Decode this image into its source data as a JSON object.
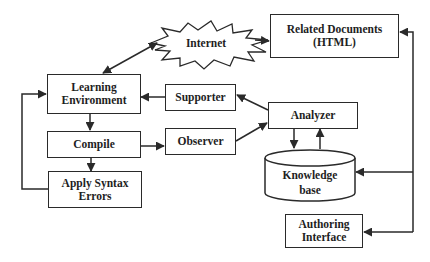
{
  "diagram": {
    "nodes": {
      "internet": {
        "label": "Internet",
        "shape": "starburst"
      },
      "related_documents": {
        "line1": "Related Documents",
        "line2": "(HTML)",
        "shape": "rectangle"
      },
      "learning_environment": {
        "line1": "Learning",
        "line2": "Environment",
        "shape": "rectangle"
      },
      "supporter": {
        "label": "Supporter",
        "shape": "rectangle"
      },
      "compile": {
        "label": "Compile",
        "shape": "rectangle"
      },
      "observer": {
        "label": "Observer",
        "shape": "rectangle"
      },
      "analyzer": {
        "label": "Analyzer",
        "shape": "rectangle"
      },
      "knowledge_base": {
        "line1": "Knowledge",
        "line2": "base",
        "shape": "cylinder"
      },
      "apply_syntax_errors": {
        "line1": "Apply Syntax",
        "line2": "Errors",
        "shape": "rectangle"
      },
      "authoring_interface": {
        "line1": "Authoring",
        "line2": "Interface",
        "shape": "rectangle"
      }
    },
    "edges": [
      {
        "from": "internet",
        "to": "learning_environment",
        "bidirectional": true
      },
      {
        "from": "internet",
        "to": "related_documents"
      },
      {
        "from": "learning_environment",
        "to": "compile"
      },
      {
        "from": "compile",
        "to": "apply_syntax_errors"
      },
      {
        "from": "apply_syntax_errors",
        "to": "learning_environment"
      },
      {
        "from": "supporter",
        "to": "learning_environment"
      },
      {
        "from": "compile",
        "to": "observer"
      },
      {
        "from": "observer",
        "to": "analyzer"
      },
      {
        "from": "analyzer",
        "to": "supporter"
      },
      {
        "from": "analyzer",
        "to": "knowledge_base"
      },
      {
        "from": "knowledge_base",
        "to": "analyzer"
      },
      {
        "from": "authoring_interface_bus",
        "to": "related_documents"
      },
      {
        "from": "authoring_interface_bus",
        "to": "knowledge_base"
      },
      {
        "from": "authoring_interface_bus",
        "to": "authoring_interface"
      }
    ],
    "colors": {
      "stroke": "#2a2a2a",
      "text": "#1e1e1e",
      "background": "#ffffff"
    }
  }
}
